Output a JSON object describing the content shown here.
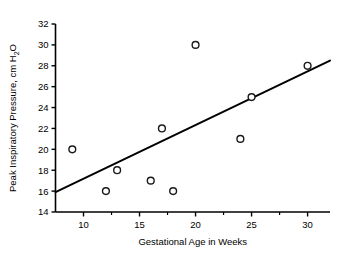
{
  "chart_data": {
    "type": "scatter",
    "title": "",
    "xlabel": "Gestational Age in Weeks",
    "ylabel": "Peak Inspiratory Pressure, cm H",
    "ylabel_subscript": "2",
    "ylabel_suffix": "O",
    "xlim": [
      7.5,
      32
    ],
    "ylim": [
      14,
      32
    ],
    "xticks": [
      10,
      15,
      20,
      25,
      30
    ],
    "xticklabels": [
      "10",
      "15",
      "20",
      "25",
      "30"
    ],
    "xminorticks": [
      12.5,
      17.5,
      22.5,
      27.5
    ],
    "yticks": [
      14,
      16,
      18,
      20,
      22,
      24,
      26,
      28,
      30,
      32
    ],
    "yticklabels": [
      "14",
      "16",
      "18",
      "20",
      "22",
      "24",
      "26",
      "28",
      "30",
      "32"
    ],
    "grid": false,
    "legend": "none",
    "marker": "open-circle",
    "x": [
      9,
      12,
      13,
      16,
      17,
      18,
      20,
      24,
      25,
      30
    ],
    "y": [
      20,
      16,
      18,
      17,
      22,
      16,
      30,
      21,
      25,
      28
    ],
    "points": [
      {
        "x": 9,
        "y": 20
      },
      {
        "x": 12,
        "y": 16
      },
      {
        "x": 13,
        "y": 18
      },
      {
        "x": 16,
        "y": 17
      },
      {
        "x": 17,
        "y": 22
      },
      {
        "x": 18,
        "y": 16
      },
      {
        "x": 20,
        "y": 30
      },
      {
        "x": 24,
        "y": 21
      },
      {
        "x": 25,
        "y": 25
      },
      {
        "x": 30,
        "y": 28
      }
    ],
    "trendline": {
      "type": "linear-fit",
      "x_start": 7.5,
      "y_start": 15.9,
      "x_end": 32,
      "y_end": 28.5
    },
    "colors": {
      "axis": "#000000",
      "marker_stroke": "#1a1a1a",
      "marker_fill": "#ffffff",
      "trendline": "#000000",
      "background": "#ffffff"
    }
  }
}
